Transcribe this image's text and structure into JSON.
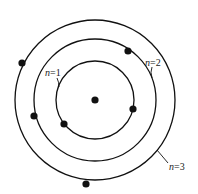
{
  "diagram": {
    "nucleus": {
      "name": "nucleus"
    },
    "orbits": [
      {
        "n": 1,
        "label_var": "n",
        "label_rest": "=1",
        "electrons": 2
      },
      {
        "n": 2,
        "label_var": "n",
        "label_rest": "=2",
        "electrons": 2
      },
      {
        "n": 3,
        "label_var": "n",
        "label_rest": "=3",
        "electrons": 2
      }
    ],
    "colors": {
      "stroke": "#111111",
      "background": "#ffffff"
    }
  }
}
